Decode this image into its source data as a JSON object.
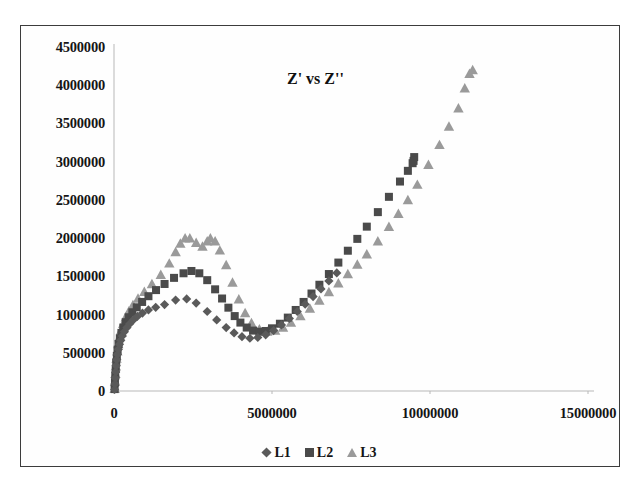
{
  "chart_data": {
    "type": "scatter",
    "title": "Z' vs Z''",
    "xlabel": "",
    "ylabel": "",
    "xlim": [
      0,
      15000000
    ],
    "ylim": [
      0,
      4500000
    ],
    "xticks": [
      "0",
      "5000000",
      "10000000",
      "15000000"
    ],
    "xtick_values": [
      0,
      5000000,
      10000000,
      15000000
    ],
    "yticks": [
      "0",
      "500000",
      "1000000",
      "1500000",
      "2000000",
      "2500000",
      "3000000",
      "3500000",
      "4000000",
      "4500000"
    ],
    "ytick_values": [
      0,
      500000,
      1000000,
      1500000,
      2000000,
      2500000,
      3000000,
      3500000,
      4000000,
      4500000
    ],
    "grid": false,
    "legend_position": "bottom",
    "series": [
      {
        "name": "L1",
        "marker": "diamond",
        "color": "#5a5a5a",
        "points": [
          [
            20000,
            20000
          ],
          [
            30000,
            90000
          ],
          [
            40000,
            170000
          ],
          [
            55000,
            250000
          ],
          [
            70000,
            330000
          ],
          [
            90000,
            410000
          ],
          [
            110000,
            480000
          ],
          [
            140000,
            545000
          ],
          [
            175000,
            610000
          ],
          [
            215000,
            665000
          ],
          [
            265000,
            720000
          ],
          [
            330000,
            775000
          ],
          [
            410000,
            830000
          ],
          [
            500000,
            880000
          ],
          [
            610000,
            930000
          ],
          [
            740000,
            975000
          ],
          [
            900000,
            1020000
          ],
          [
            1090000,
            1060000
          ],
          [
            1320000,
            1095000
          ],
          [
            1600000,
            1130000
          ],
          [
            1950000,
            1190000
          ],
          [
            2300000,
            1205000
          ],
          [
            2600000,
            1150000
          ],
          [
            2950000,
            1040000
          ],
          [
            3250000,
            930000
          ],
          [
            3550000,
            830000
          ],
          [
            3800000,
            760000
          ],
          [
            4050000,
            710000
          ],
          [
            4300000,
            690000
          ],
          [
            4550000,
            700000
          ],
          [
            4800000,
            735000
          ],
          [
            5050000,
            790000
          ],
          [
            5300000,
            865000
          ],
          [
            5550000,
            950000
          ],
          [
            5800000,
            1040000
          ],
          [
            6050000,
            1135000
          ],
          [
            6300000,
            1235000
          ],
          [
            6550000,
            1335000
          ],
          [
            6800000,
            1440000
          ],
          [
            7050000,
            1545000
          ]
        ]
      },
      {
        "name": "L2",
        "marker": "square",
        "color": "#4a4a4a",
        "points": [
          [
            20000,
            25000
          ],
          [
            30000,
            110000
          ],
          [
            40000,
            200000
          ],
          [
            55000,
            290000
          ],
          [
            70000,
            375000
          ],
          [
            90000,
            460000
          ],
          [
            115000,
            540000
          ],
          [
            145000,
            615000
          ],
          [
            185000,
            690000
          ],
          [
            235000,
            760000
          ],
          [
            295000,
            830000
          ],
          [
            370000,
            900000
          ],
          [
            465000,
            965000
          ],
          [
            580000,
            1030000
          ],
          [
            720000,
            1095000
          ],
          [
            890000,
            1165000
          ],
          [
            1090000,
            1240000
          ],
          [
            1330000,
            1320000
          ],
          [
            1600000,
            1400000
          ],
          [
            1900000,
            1480000
          ],
          [
            2200000,
            1540000
          ],
          [
            2450000,
            1570000
          ],
          [
            2700000,
            1540000
          ],
          [
            2950000,
            1450000
          ],
          [
            3200000,
            1330000
          ],
          [
            3420000,
            1210000
          ],
          [
            3620000,
            1090000
          ],
          [
            3820000,
            980000
          ],
          [
            4000000,
            895000
          ],
          [
            4200000,
            830000
          ],
          [
            4400000,
            790000
          ],
          [
            4600000,
            775000
          ],
          [
            4800000,
            785000
          ],
          [
            5000000,
            820000
          ],
          [
            5250000,
            880000
          ],
          [
            5500000,
            960000
          ],
          [
            5750000,
            1060000
          ],
          [
            6000000,
            1165000
          ],
          [
            6250000,
            1275000
          ],
          [
            6500000,
            1390000
          ],
          [
            6800000,
            1530000
          ],
          [
            7100000,
            1680000
          ],
          [
            7400000,
            1835000
          ],
          [
            7700000,
            1990000
          ],
          [
            8000000,
            2150000
          ],
          [
            8350000,
            2340000
          ],
          [
            8700000,
            2540000
          ],
          [
            9050000,
            2740000
          ],
          [
            9300000,
            2880000
          ],
          [
            9450000,
            2980000
          ],
          [
            9500000,
            3060000
          ],
          [
            9480000,
            3010000
          ]
        ]
      },
      {
        "name": "L3",
        "marker": "triangle",
        "color": "#9a9a9a",
        "points": [
          [
            20000,
            30000
          ],
          [
            30000,
            125000
          ],
          [
            45000,
            225000
          ],
          [
            60000,
            325000
          ],
          [
            80000,
            425000
          ],
          [
            105000,
            520000
          ],
          [
            135000,
            615000
          ],
          [
            175000,
            705000
          ],
          [
            225000,
            795000
          ],
          [
            290000,
            880000
          ],
          [
            370000,
            965000
          ],
          [
            470000,
            1045000
          ],
          [
            600000,
            1125000
          ],
          [
            760000,
            1210000
          ],
          [
            960000,
            1300000
          ],
          [
            1200000,
            1400000
          ],
          [
            1480000,
            1520000
          ],
          [
            1750000,
            1670000
          ],
          [
            1950000,
            1820000
          ],
          [
            2100000,
            1930000
          ],
          [
            2250000,
            2000000
          ],
          [
            2400000,
            2000000
          ],
          [
            2600000,
            1940000
          ],
          [
            2800000,
            1890000
          ],
          [
            2950000,
            1960000
          ],
          [
            3050000,
            2000000
          ],
          [
            3200000,
            1960000
          ],
          [
            3350000,
            1840000
          ],
          [
            3550000,
            1650000
          ],
          [
            3750000,
            1420000
          ],
          [
            3950000,
            1200000
          ],
          [
            4150000,
            1020000
          ],
          [
            4350000,
            890000
          ],
          [
            4600000,
            810000
          ],
          [
            4850000,
            780000
          ],
          [
            5100000,
            790000
          ],
          [
            5350000,
            830000
          ],
          [
            5600000,
            895000
          ],
          [
            5900000,
            980000
          ],
          [
            6200000,
            1080000
          ],
          [
            6500000,
            1185000
          ],
          [
            6800000,
            1295000
          ],
          [
            7100000,
            1410000
          ],
          [
            7400000,
            1530000
          ],
          [
            7700000,
            1655000
          ],
          [
            8000000,
            1790000
          ],
          [
            8350000,
            1960000
          ],
          [
            8700000,
            2150000
          ],
          [
            9000000,
            2320000
          ],
          [
            9300000,
            2500000
          ],
          [
            9600000,
            2700000
          ],
          [
            9950000,
            2960000
          ],
          [
            10300000,
            3220000
          ],
          [
            10600000,
            3460000
          ],
          [
            10900000,
            3700000
          ],
          [
            11100000,
            3960000
          ],
          [
            11250000,
            4150000
          ],
          [
            11350000,
            4200000
          ]
        ]
      }
    ]
  },
  "legend": {
    "entries": [
      {
        "label": "L1",
        "marker": "diamond",
        "color": "#5a5a5a"
      },
      {
        "label": "L2",
        "marker": "square",
        "color": "#4a4a4a"
      },
      {
        "label": "L3",
        "marker": "triangle",
        "color": "#9a9a9a"
      }
    ]
  },
  "axes": {
    "axis_color": "#b8b8b8",
    "border_color": "#3c3c3c"
  }
}
